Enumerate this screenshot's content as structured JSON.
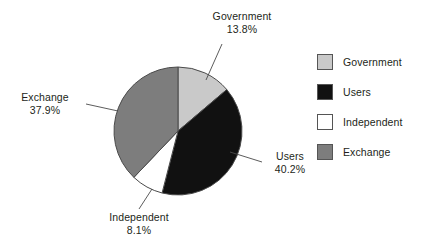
{
  "chart_data": {
    "type": "pie",
    "title": "",
    "categories": [
      "Government",
      "Users",
      "Independent",
      "Exchange"
    ],
    "values": [
      13.8,
      40.2,
      8.1,
      37.9
    ],
    "value_suffix": "%",
    "start_angle_deg": 0,
    "direction": "clockwise",
    "colors": [
      "#c9c9c9",
      "#111111",
      "#ffffff",
      "#7d7d7d"
    ],
    "legend_position": "right",
    "grid": false,
    "slices": [
      {
        "label": "Government",
        "value": 13.8,
        "display": "13.8%",
        "color": "#c9c9c9"
      },
      {
        "label": "Users",
        "value": 40.2,
        "display": "40.2%",
        "color": "#111111"
      },
      {
        "label": "Independent",
        "value": 8.1,
        "display": "8.1%",
        "color": "#ffffff"
      },
      {
        "label": "Exchange",
        "value": 37.9,
        "display": "37.9%",
        "color": "#7d7d7d"
      }
    ]
  },
  "callouts": {
    "government": {
      "category": "Government",
      "percent": "13.8%"
    },
    "exchange": {
      "category": "Exchange",
      "percent": "37.9%"
    },
    "users": {
      "category": "Users",
      "percent": "40.2%"
    },
    "independent": {
      "category": "Independent",
      "percent": "8.1%"
    }
  },
  "legend": {
    "items": [
      {
        "label": "Government",
        "color": "#c9c9c9"
      },
      {
        "label": "Users",
        "color": "#111111"
      },
      {
        "label": "Independent",
        "color": "#ffffff"
      },
      {
        "label": "Exchange",
        "color": "#7d7d7d"
      }
    ]
  }
}
